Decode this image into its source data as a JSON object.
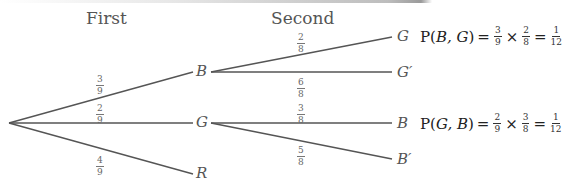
{
  "header": {
    "first_label": "First",
    "second_label": "Second"
  },
  "first_stage": {
    "root": "",
    "branches": [
      {
        "node": "B",
        "prob_num": "3",
        "prob_den": "9"
      },
      {
        "node": "G",
        "prob_num": "2",
        "prob_den": "9"
      },
      {
        "node": "R",
        "prob_num": "4",
        "prob_den": "9"
      }
    ]
  },
  "second_stage": {
    "from_B": [
      {
        "node": "G",
        "prob_num": "2",
        "prob_den": "8"
      },
      {
        "node": "G′",
        "prob_num": "6",
        "prob_den": "8"
      }
    ],
    "from_G": [
      {
        "node": "B",
        "prob_num": "3",
        "prob_den": "8"
      },
      {
        "node": "B′",
        "prob_num": "5",
        "prob_den": "8"
      }
    ]
  },
  "formulas": [
    {
      "prefix": "P(",
      "args": "B, G",
      "suffix": ")",
      "eq": "=",
      "a_num": "3",
      "a_den": "9",
      "times": "×",
      "b_num": "2",
      "b_den": "8",
      "eq2": "=",
      "r_num": "1",
      "r_den": "12"
    },
    {
      "prefix": "P(",
      "args": "G, B",
      "suffix": ")",
      "eq": "=",
      "a_num": "2",
      "a_den": "9",
      "times": "×",
      "b_num": "3",
      "b_den": "8",
      "eq2": "=",
      "r_num": "1",
      "r_den": "12"
    }
  ],
  "colors": {
    "line": "#555555",
    "text": "#555555"
  }
}
